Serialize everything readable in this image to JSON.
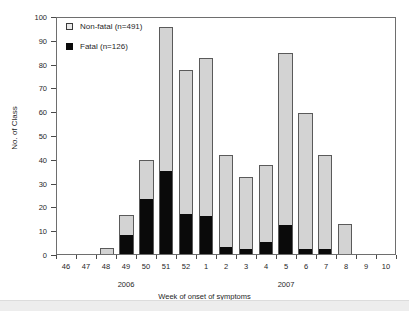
{
  "chart_data": {
    "type": "bar",
    "title": "",
    "subtitle": "",
    "xlabel": "Week of onset of symptoms",
    "ylabel": "No. of Class",
    "ylim": [
      0,
      100
    ],
    "yticks": [
      0,
      10,
      20,
      30,
      40,
      50,
      60,
      70,
      80,
      90,
      100
    ],
    "grid": false,
    "stacked": true,
    "legend_position": "top-left",
    "categories": [
      "46",
      "47",
      "48",
      "49",
      "50",
      "51",
      "52",
      "1",
      "2",
      "3",
      "4",
      "5",
      "6",
      "7",
      "8",
      "9",
      "10"
    ],
    "group_labels": [
      {
        "label": "2006",
        "center_category": "49"
      },
      {
        "label": "2007",
        "center_category": "5"
      }
    ],
    "series": [
      {
        "name": "Fatal (n=126)",
        "color": "#0a0a0a",
        "values": [
          0,
          0,
          0,
          8,
          23,
          35,
          17,
          16,
          3,
          2,
          5,
          12,
          2,
          2,
          0,
          0,
          0
        ]
      },
      {
        "name": "Non-fatal (n=491)",
        "color": "#d3d3d3",
        "values": [
          0,
          0,
          2,
          8,
          16,
          60,
          60,
          66,
          38,
          30,
          32,
          72,
          57,
          39,
          12,
          0,
          0
        ]
      }
    ],
    "totals": [
      0,
      0,
      2,
      16,
      39,
      95,
      77,
      82,
      41,
      32,
      37,
      84,
      59,
      41,
      12,
      0,
      0
    ]
  },
  "legend": {
    "items": [
      {
        "label": "Non-fatal (n=491)",
        "swatch": "nonfatal"
      },
      {
        "label": "Fatal (n=126)",
        "swatch": "fatal"
      }
    ]
  },
  "colors": {
    "nonfatal": "#d3d3d3",
    "fatal": "#0a0a0a",
    "axis": "#6e6e6e",
    "text": "#1f1f1f"
  }
}
